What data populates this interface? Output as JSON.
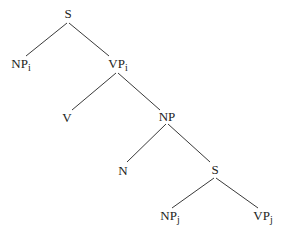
{
  "diagram": {
    "type": "syntax-tree",
    "nodes": {
      "root_s": {
        "label": "S",
        "sub": ""
      },
      "np_i": {
        "label": "NP",
        "sub": "i"
      },
      "vp_i": {
        "label": "VP",
        "sub": "i"
      },
      "v": {
        "label": "V",
        "sub": ""
      },
      "np": {
        "label": "NP",
        "sub": ""
      },
      "n": {
        "label": "N",
        "sub": ""
      },
      "s_embedded": {
        "label": "S",
        "sub": ""
      },
      "np_j": {
        "label": "NP",
        "sub": "j"
      },
      "vp_j": {
        "label": "VP",
        "sub": "j"
      }
    },
    "edges": [
      [
        "root_s",
        "np_i"
      ],
      [
        "root_s",
        "vp_i"
      ],
      [
        "vp_i",
        "v"
      ],
      [
        "vp_i",
        "np"
      ],
      [
        "np",
        "n"
      ],
      [
        "np",
        "s_embedded"
      ],
      [
        "s_embedded",
        "np_j"
      ],
      [
        "s_embedded",
        "vp_j"
      ]
    ],
    "colors": {
      "line": "#3a3a3a",
      "text": "#222222",
      "background": "#ffffff"
    }
  }
}
